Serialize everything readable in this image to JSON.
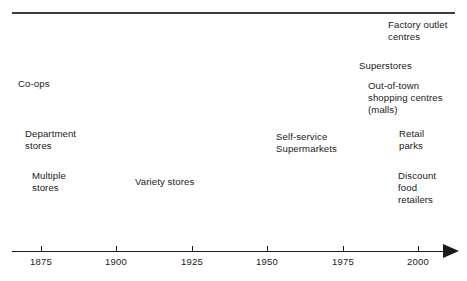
{
  "figure": {
    "background_color": "#ffffff",
    "line_color": "#1a1a1a",
    "rule_color": "#3d3d3d"
  },
  "chart_data": {
    "type": "table",
    "title": "",
    "xlabel": "",
    "ylabel": "",
    "grid": false,
    "legend": "none",
    "axis": {
      "orientation": "horizontal",
      "arrow": "right",
      "range": [
        1862,
        2012
      ],
      "tick_labels": [
        "1875",
        "1900",
        "1925",
        "1950",
        "1975",
        "2000"
      ],
      "tick_values": [
        1875,
        1900,
        1925,
        1950,
        1975,
        2000
      ]
    },
    "categories": [
      "Co-ops",
      "Department stores",
      "Multiple stores",
      "Variety stores",
      "Self-service Supermarkets",
      "Superstores",
      "Out-of-town shopping centres (malls)",
      "Retail parks",
      "Factory outlet centres",
      "Discount food retailers"
    ],
    "values": [
      1872,
      1878,
      1883,
      1920,
      1948,
      1972,
      1975,
      1990,
      1992,
      1993
    ],
    "annotations": [
      "Co-ops",
      "Department stores",
      "Multiple stores",
      "Variety stores",
      "Self-service Supermarkets",
      "Factory outlet centres",
      "Superstores",
      "Out-of-town shopping centres (malls)",
      "Retail parks",
      "Discount food retailers"
    ]
  },
  "ticks": [
    {
      "label": "1875",
      "x": 41
    },
    {
      "label": "1900",
      "x": 116
    },
    {
      "label": "1925",
      "x": 192
    },
    {
      "label": "1950",
      "x": 267
    },
    {
      "label": "1975",
      "x": 343
    },
    {
      "label": "2000",
      "x": 418
    }
  ],
  "events": [
    {
      "name": "factory-outlet-centres",
      "line1": "Factory outlet",
      "line2": "centres",
      "line3": "",
      "x": 388,
      "y": 19
    },
    {
      "name": "superstores",
      "line1": "Superstores",
      "line2": "",
      "line3": "",
      "x": 359,
      "y": 60
    },
    {
      "name": "out-of-town-centres",
      "line1": "Out-of-town",
      "line2": "shopping centres",
      "line3": "(malls)",
      "x": 368,
      "y": 80
    },
    {
      "name": "co-ops",
      "line1": "Co-ops",
      "line2": "",
      "line3": "",
      "x": 18,
      "y": 78
    },
    {
      "name": "department-stores",
      "line1": "Department",
      "line2": "stores",
      "line3": "",
      "x": 25,
      "y": 128
    },
    {
      "name": "self-service-supermarkets",
      "line1": "Self-service",
      "line2": "Supermarkets",
      "line3": "",
      "x": 276,
      "y": 131
    },
    {
      "name": "retail-parks",
      "line1": "Retail",
      "line2": "parks",
      "line3": "",
      "x": 399,
      "y": 128
    },
    {
      "name": "multiple-stores",
      "line1": "Multiple",
      "line2": "stores",
      "line3": "",
      "x": 32,
      "y": 170
    },
    {
      "name": "variety-stores",
      "line1": "Variety stores",
      "line2": "",
      "line3": "",
      "x": 135,
      "y": 176
    },
    {
      "name": "discount-food-retailers",
      "line1": "Discount",
      "line2": "food",
      "line3": "retailers",
      "x": 398,
      "y": 170
    }
  ]
}
